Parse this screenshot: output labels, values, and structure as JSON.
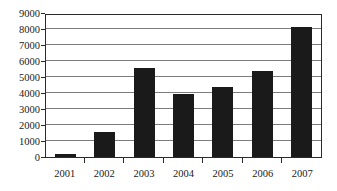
{
  "chart_data": {
    "type": "bar",
    "title": "",
    "subtitle": "",
    "xlabel": "",
    "ylabel": "",
    "categories": [
      "2001",
      "2002",
      "2003",
      "2004",
      "2005",
      "2006",
      "2007"
    ],
    "values": [
      200,
      1550,
      5550,
      3950,
      4350,
      5400,
      8150
    ],
    "series": [
      {
        "name": "",
        "values": [
          200,
          1550,
          5550,
          3950,
          4350,
          5400,
          8150
        ]
      }
    ],
    "ylim": [
      0,
      9000
    ],
    "ytick_values": [
      0,
      1000,
      2000,
      3000,
      4000,
      5000,
      6000,
      7000,
      8000,
      9000
    ],
    "ytick_labels": [
      "0",
      "1000",
      "2000",
      "3000",
      "4000",
      "5000",
      "6000",
      "7000",
      "8000",
      "9000"
    ],
    "grid": true,
    "grid_axis": "y",
    "legend": false,
    "legend_position": "none",
    "annotations": [],
    "colors": {
      "bar": "#1a1a1a",
      "gridline": "#7d7d7d",
      "axis": "#2b2b2b",
      "background": "#ffffff",
      "text": "#1a1a1a"
    }
  }
}
